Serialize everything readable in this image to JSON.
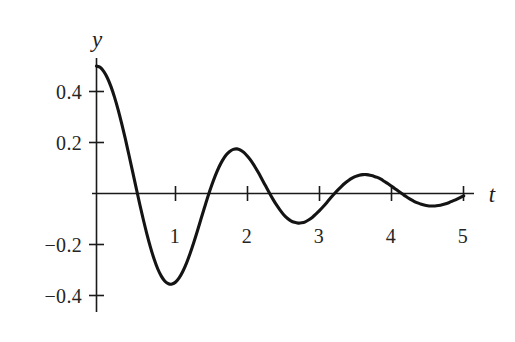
{
  "chart_data": {
    "type": "line",
    "title": "",
    "subtitle": "",
    "xlabel": "t",
    "ylabel": "y",
    "xlim": [
      -0.07,
      5.35
    ],
    "ylim": [
      -0.46,
      0.56
    ],
    "grid": false,
    "legend": "none",
    "annotations": [],
    "x_ticks": [
      {
        "value": 1,
        "label": "1"
      },
      {
        "value": 2,
        "label": "2"
      },
      {
        "value": 3,
        "label": "3"
      },
      {
        "value": 4,
        "label": "4"
      },
      {
        "value": 5,
        "label": "5"
      }
    ],
    "y_ticks": [
      {
        "value": 0.4,
        "label": "0.4"
      },
      {
        "value": 0.2,
        "label": "0.2"
      },
      {
        "value": -0.2,
        "label": "−0.2"
      },
      {
        "value": -0.4,
        "label": "−0.4"
      }
    ],
    "series": [
      {
        "name": "damped-oscillation",
        "color": "#141414",
        "x": [
          0.0,
          0.05,
          0.1,
          0.15,
          0.2,
          0.25,
          0.3,
          0.35,
          0.4,
          0.45,
          0.5,
          0.55,
          0.6,
          0.65,
          0.7,
          0.75,
          0.8,
          0.85,
          0.9,
          0.95,
          1.0,
          1.05,
          1.1,
          1.15,
          1.2,
          1.25,
          1.3,
          1.35,
          1.4,
          1.45,
          1.5,
          1.55,
          1.6,
          1.65,
          1.7,
          1.75,
          1.8,
          1.85,
          1.9,
          1.95,
          2.0,
          2.05,
          2.1,
          2.15,
          2.2,
          2.25,
          2.3,
          2.35,
          2.4,
          2.45,
          2.5,
          2.55,
          2.6,
          2.65,
          2.7,
          2.75,
          2.8,
          2.85,
          2.9,
          2.95,
          3.0,
          3.05,
          3.1,
          3.15,
          3.2,
          3.25,
          3.3,
          3.35,
          3.4,
          3.45,
          3.5,
          3.55,
          3.6,
          3.65,
          3.7,
          3.75,
          3.8,
          3.85,
          3.9,
          3.95,
          4.0,
          4.05,
          4.1,
          4.15,
          4.2,
          4.25,
          4.3,
          4.35,
          4.4,
          4.45,
          4.5,
          4.55,
          4.6,
          4.65,
          4.7,
          4.75,
          4.8,
          4.85,
          4.9,
          4.95,
          5.0,
          5.05,
          5.1
        ],
        "y": [
          0.5,
          0.495,
          0.479,
          0.454,
          0.42,
          0.378,
          0.329,
          0.274,
          0.215,
          0.152,
          0.088,
          0.023,
          -0.041,
          -0.102,
          -0.159,
          -0.211,
          -0.257,
          -0.295,
          -0.324,
          -0.344,
          -0.354,
          -0.355,
          -0.347,
          -0.33,
          -0.305,
          -0.273,
          -0.235,
          -0.193,
          -0.148,
          -0.101,
          -0.055,
          -0.01,
          0.032,
          0.07,
          0.103,
          0.13,
          0.151,
          0.165,
          0.173,
          0.175,
          0.17,
          0.16,
          0.145,
          0.127,
          0.105,
          0.081,
          0.055,
          0.029,
          0.003,
          -0.022,
          -0.045,
          -0.065,
          -0.083,
          -0.097,
          -0.107,
          -0.113,
          -0.116,
          -0.115,
          -0.111,
          -0.103,
          -0.093,
          -0.08,
          -0.066,
          -0.051,
          -0.035,
          -0.018,
          -0.002,
          0.013,
          0.027,
          0.04,
          0.051,
          0.06,
          0.067,
          0.072,
          0.074,
          0.074,
          0.072,
          0.068,
          0.063,
          0.056,
          0.047,
          0.038,
          0.028,
          0.018,
          0.008,
          -0.002,
          -0.012,
          -0.021,
          -0.029,
          -0.036,
          -0.041,
          -0.045,
          -0.048,
          -0.049,
          -0.049,
          -0.047,
          -0.044,
          -0.04,
          -0.035,
          -0.029,
          -0.023,
          -0.016,
          -0.009
        ],
        "features": {
          "start_value": 0.5,
          "peaks": [
            {
              "t": 0.0,
              "y": 0.5
            },
            {
              "t": 1.6,
              "y": 0.23
            },
            {
              "t": 2.9,
              "y": 0.11
            },
            {
              "t": 4.3,
              "y": 0.05
            }
          ],
          "troughs": [
            {
              "t": 1.1,
              "y": -0.34
            },
            {
              "t": 2.25,
              "y": -0.16
            },
            {
              "t": 3.5,
              "y": -0.075
            }
          ],
          "zero_crossings": [
            0.55,
            1.55,
            2.45,
            3.3,
            4.05,
            4.85
          ]
        }
      }
    ]
  }
}
